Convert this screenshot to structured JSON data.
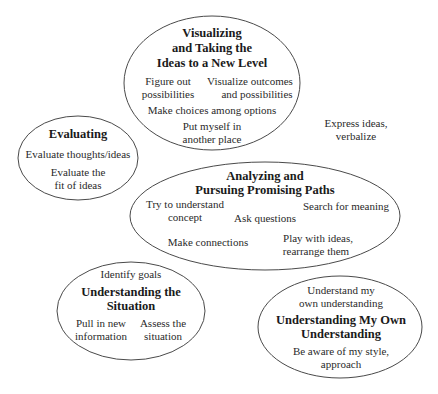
{
  "diagram": {
    "stroke_color": "#4a4a4a",
    "text_color": "#2a2a2a",
    "nodes": [
      {
        "id": "visualizing",
        "title_lines": [
          "Visualizing",
          "and Taking the",
          "Ideas to a New Level"
        ],
        "items": [
          {
            "lines": [
              "Figure out",
              "possibilities"
            ]
          },
          {
            "lines": [
              "Visualize outcomes",
              "and possibilities"
            ]
          },
          {
            "lines": [
              "Make choices among options"
            ]
          },
          {
            "lines": [
              "Put myself in",
              "another place"
            ]
          }
        ]
      },
      {
        "id": "evaluating",
        "title_lines": [
          "Evaluating"
        ],
        "items": [
          {
            "lines": [
              "Evaluate thoughts/ideas"
            ]
          },
          {
            "lines": [
              "Evaluate the",
              "fit of ideas"
            ]
          }
        ]
      },
      {
        "id": "analyzing",
        "title_lines": [
          "Analyzing and",
          "Pursuing Promising Paths"
        ],
        "items": [
          {
            "lines": [
              "Try to understand",
              "concept"
            ]
          },
          {
            "lines": [
              "Ask questions"
            ]
          },
          {
            "lines": [
              "Search for meaning"
            ]
          },
          {
            "lines": [
              "Make connections"
            ]
          },
          {
            "lines": [
              "Play with ideas,",
              "rearrange them"
            ]
          }
        ]
      },
      {
        "id": "understanding-situation",
        "title_lines": [
          "Understanding the",
          "Situation"
        ],
        "items": [
          {
            "lines": [
              "Identify goals"
            ]
          },
          {
            "lines": [
              "Pull in new",
              "information"
            ]
          },
          {
            "lines": [
              "Assess the",
              "situation"
            ]
          }
        ]
      },
      {
        "id": "understanding-own",
        "title_lines": [
          "Understanding My Own",
          "Understanding"
        ],
        "items": [
          {
            "lines": [
              "Understand my",
              "own understanding"
            ]
          },
          {
            "lines": [
              "Be aware of my style,",
              "approach"
            ]
          }
        ]
      }
    ],
    "free_text": {
      "lines": [
        "Express ideas,",
        "verbalize"
      ]
    }
  }
}
